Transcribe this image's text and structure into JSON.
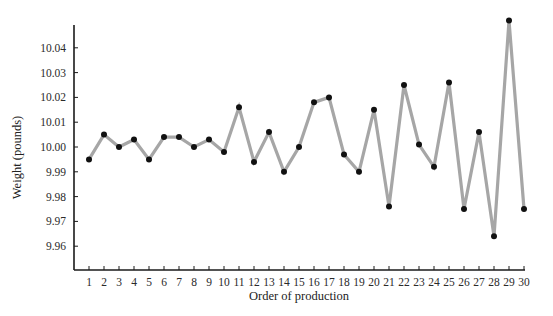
{
  "chart_data": {
    "type": "line",
    "title": "",
    "xlabel": "Order of production",
    "ylabel": "Weight (pounds)",
    "x": [
      1,
      2,
      3,
      4,
      5,
      6,
      7,
      8,
      9,
      10,
      11,
      12,
      13,
      14,
      15,
      16,
      17,
      18,
      19,
      20,
      21,
      22,
      23,
      24,
      25,
      26,
      27,
      28,
      29,
      30
    ],
    "series": [
      {
        "name": "Weight",
        "values": [
          9.995,
          10.005,
          10.0,
          10.003,
          9.995,
          10.004,
          10.004,
          10.0,
          10.003,
          9.998,
          10.016,
          9.994,
          10.006,
          9.99,
          10.0,
          10.018,
          10.02,
          9.997,
          9.99,
          10.015,
          9.976,
          10.025,
          10.001,
          9.992,
          10.026,
          9.975,
          10.006,
          9.964,
          10.051,
          9.975
        ],
        "line_color": "#a6a6a6",
        "marker_color": "#111111"
      }
    ],
    "yticks": [
      "9.96",
      "9.97",
      "9.98",
      "9.99",
      "10.00",
      "10.01",
      "10.02",
      "10.03",
      "10.04"
    ],
    "xticks": [
      "1",
      "2",
      "3",
      "4",
      "5",
      "6",
      "7",
      "8",
      "9",
      "10",
      "11",
      "12",
      "13",
      "14",
      "15",
      "16",
      "17",
      "18",
      "19",
      "20",
      "21",
      "22",
      "23",
      "24",
      "25",
      "26",
      "27",
      "28",
      "29",
      "30"
    ],
    "ylim": [
      9.95,
      10.05
    ],
    "xlim": [
      0,
      30
    ],
    "grid": false,
    "legend": null
  }
}
